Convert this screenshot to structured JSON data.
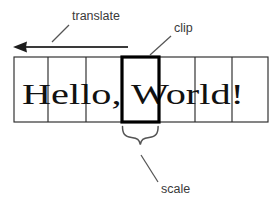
{
  "figure": {
    "background_color": "#ffffff",
    "ink_color": "#111111",
    "annotation_color": "#3a3a3a",
    "clip_color": "#000000"
  },
  "strip": {
    "text": "Hello, World!",
    "left": 14,
    "right": 268,
    "top": 57,
    "bottom": 122,
    "cell_boundaries": [
      14,
      48,
      86,
      122,
      159,
      195,
      232,
      268
    ],
    "cells": [
      {
        "label": "cell-1",
        "x": 14,
        "width": 34,
        "clipped": false
      },
      {
        "label": "cell-2",
        "x": 48,
        "width": 38,
        "clipped": false
      },
      {
        "label": "cell-3",
        "x": 86,
        "width": 36,
        "clipped": false
      },
      {
        "label": "cell-4",
        "x": 122,
        "width": 37,
        "clipped": true
      },
      {
        "label": "cell-5",
        "x": 159,
        "width": 36,
        "clipped": false
      },
      {
        "label": "cell-6",
        "x": 195,
        "width": 37,
        "clipped": false
      },
      {
        "label": "cell-7",
        "x": 232,
        "width": 36,
        "clipped": false
      }
    ],
    "text_x": 22,
    "text_baseline": 104,
    "text_size": 30
  },
  "annotations": {
    "translate": {
      "label": "translate",
      "label_x": 72,
      "label_y": 20,
      "leader": {
        "x1": 69,
        "y1": 25,
        "x2": 52,
        "y2": 42
      },
      "arrow": {
        "tip_x": 13,
        "tail_x": 128,
        "y": 47,
        "direction": "left"
      }
    },
    "clip": {
      "label": "clip",
      "label_x": 174,
      "label_y": 32,
      "leader": {
        "x1": 171,
        "y1": 36,
        "x2": 150,
        "y2": 55
      }
    },
    "scale": {
      "label": "scale",
      "label_x": 161,
      "label_y": 193,
      "leader": {
        "x1": 158,
        "y1": 182,
        "x2": 141,
        "y2": 155
      },
      "brace": {
        "left": 122,
        "right": 158,
        "top": 126,
        "depth": 12,
        "center": 140
      }
    }
  }
}
